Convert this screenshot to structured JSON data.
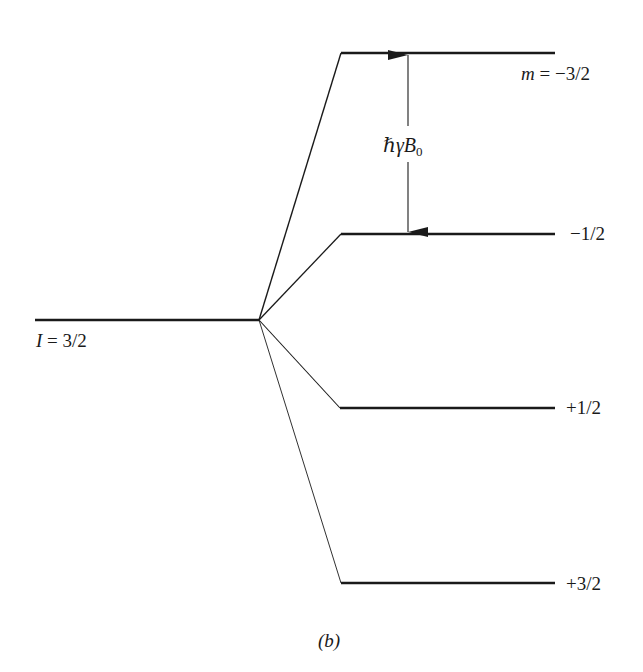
{
  "figure": {
    "caption": "(b)",
    "ground_state": {
      "symbol": "I",
      "equals": " = ",
      "value": "3/2"
    },
    "levels": [
      {
        "prefix_symbol": "m",
        "prefix_equals": " = ",
        "label": "−3/2",
        "order": 1
      },
      {
        "label": "−1/2",
        "order": 2
      },
      {
        "label": "+1/2",
        "order": 3
      },
      {
        "label": "+3/2",
        "order": 4
      }
    ],
    "splitting": {
      "hbar": "ℏ",
      "gamma": "γ",
      "B": "B",
      "subscript": "0"
    },
    "colors": {
      "line": "#1a1a1a",
      "background": "#ffffff"
    }
  }
}
